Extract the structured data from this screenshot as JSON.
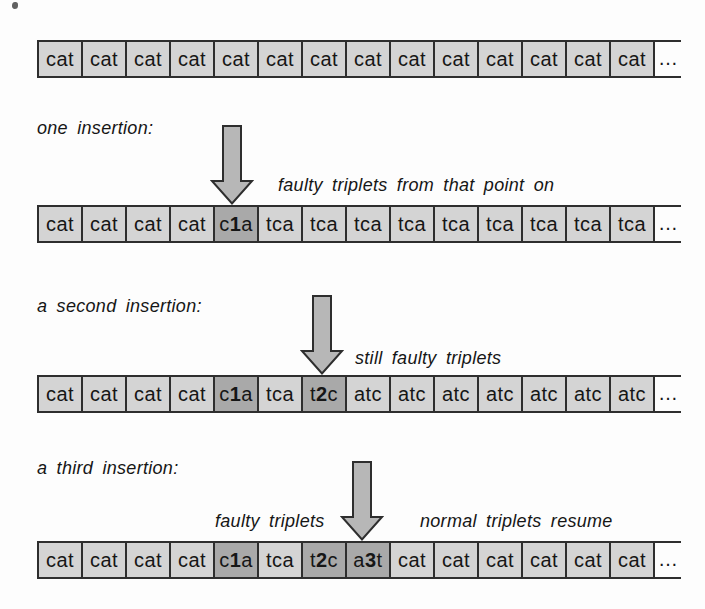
{
  "colors": {
    "background": "#fdfdfd",
    "cell_fill": "#d4d4d4",
    "highlight_fill": "#a9a9a9",
    "arrow_fill": "#b7b7b7",
    "border": "#2e2e2e",
    "text": "#161616"
  },
  "labels": {
    "one_insertion": "one insertion:",
    "second_insertion": "a second insertion:",
    "third_insertion": "a third insertion:"
  },
  "annotations": {
    "row2": "faulty triplets from that point on",
    "row3": "still faulty triplets",
    "row4_left": "faulty triplets",
    "row4_right": "normal triplets resume"
  },
  "ellipsis": "…",
  "rows": [
    {
      "name": "normal-triplets",
      "cells": [
        {
          "text": "cat"
        },
        {
          "text": "cat"
        },
        {
          "text": "cat"
        },
        {
          "text": "cat"
        },
        {
          "text": "cat"
        },
        {
          "text": "cat"
        },
        {
          "text": "cat"
        },
        {
          "text": "cat"
        },
        {
          "text": "cat"
        },
        {
          "text": "cat"
        },
        {
          "text": "cat"
        },
        {
          "text": "cat"
        },
        {
          "text": "cat"
        },
        {
          "text": "cat"
        }
      ]
    },
    {
      "name": "one-insertion",
      "cells": [
        {
          "text": "cat"
        },
        {
          "text": "cat"
        },
        {
          "text": "cat"
        },
        {
          "text": "cat"
        },
        {
          "text": "c1a",
          "bold_index": 1,
          "highlight": true
        },
        {
          "text": "tca"
        },
        {
          "text": "tca"
        },
        {
          "text": "tca"
        },
        {
          "text": "tca"
        },
        {
          "text": "tca"
        },
        {
          "text": "tca"
        },
        {
          "text": "tca"
        },
        {
          "text": "tca"
        },
        {
          "text": "tca"
        }
      ]
    },
    {
      "name": "second-insertion",
      "cells": [
        {
          "text": "cat"
        },
        {
          "text": "cat"
        },
        {
          "text": "cat"
        },
        {
          "text": "cat"
        },
        {
          "text": "c1a",
          "bold_index": 1,
          "highlight": true
        },
        {
          "text": "tca"
        },
        {
          "text": "t2c",
          "bold_index": 1,
          "highlight": true
        },
        {
          "text": "atc"
        },
        {
          "text": "atc"
        },
        {
          "text": "atc"
        },
        {
          "text": "atc"
        },
        {
          "text": "atc"
        },
        {
          "text": "atc"
        },
        {
          "text": "atc"
        }
      ]
    },
    {
      "name": "third-insertion",
      "cells": [
        {
          "text": "cat"
        },
        {
          "text": "cat"
        },
        {
          "text": "cat"
        },
        {
          "text": "cat"
        },
        {
          "text": "c1a",
          "bold_index": 1,
          "highlight": true
        },
        {
          "text": "tca"
        },
        {
          "text": "t2c",
          "bold_index": 1,
          "highlight": true
        },
        {
          "text": "a3t",
          "bold_index": 1,
          "highlight": true
        },
        {
          "text": "cat"
        },
        {
          "text": "cat"
        },
        {
          "text": "cat"
        },
        {
          "text": "cat"
        },
        {
          "text": "cat"
        },
        {
          "text": "cat"
        }
      ]
    }
  ]
}
